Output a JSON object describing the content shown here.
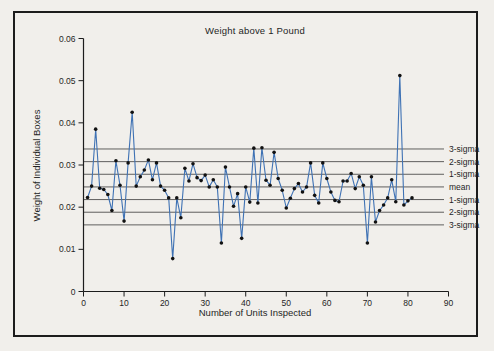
{
  "figure": {
    "title": "Weight above 1 Pound",
    "x_axis_label": "Number of Units Inspected",
    "y_axis_label": "Weight of Individual Boxes"
  },
  "colors": {
    "page_background": "#f1efeb",
    "frame_border": "#1c1c1c",
    "axis": "#1c1c1c",
    "data_line": "#3f72b4",
    "marker": "#111111",
    "control_line": "#3a3a3a",
    "text": "#1f1f1f"
  },
  "chart_data": {
    "type": "line",
    "title": "Weight above 1 Pound",
    "xlabel": "Number of Units Inspected",
    "ylabel": "Weight of Individual Boxes",
    "xlim": [
      0,
      90
    ],
    "ylim": [
      0,
      0.06
    ],
    "grid": false,
    "legend_position": "none",
    "x_ticks": [
      0,
      10,
      20,
      30,
      40,
      50,
      60,
      70,
      80,
      90
    ],
    "x_tick_labels": [
      "0",
      "10",
      "20",
      "30",
      "40",
      "50",
      "60",
      "70",
      "80",
      "90"
    ],
    "y_ticks": [
      0,
      0.01,
      0.02,
      0.03,
      0.04,
      0.05,
      0.06
    ],
    "y_tick_labels": [
      "0",
      "0.01",
      "0.02",
      "0.03",
      "0.04",
      "0.05",
      "0.06"
    ],
    "control_lines": [
      {
        "label": "3-sigma",
        "value": 0.0338
      },
      {
        "label": "2-sigma",
        "value": 0.0308
      },
      {
        "label": "1-sigma",
        "value": 0.0278
      },
      {
        "label": "mean",
        "value": 0.0248
      },
      {
        "label": "1-sigma",
        "value": 0.0218
      },
      {
        "label": "2-sigma",
        "value": 0.0188
      },
      {
        "label": "3-sigma",
        "value": 0.0158
      }
    ],
    "series": [
      {
        "name": "individual box weights",
        "x": [
          1,
          2,
          3,
          4,
          5,
          6,
          7,
          8,
          9,
          10,
          11,
          12,
          13,
          14,
          15,
          16,
          17,
          18,
          19,
          20,
          21,
          22,
          23,
          24,
          25,
          26,
          27,
          28,
          29,
          30,
          31,
          32,
          33,
          34,
          35,
          36,
          37,
          38,
          39,
          40,
          41,
          42,
          43,
          44,
          45,
          46,
          47,
          48,
          49,
          50,
          51,
          52,
          53,
          54,
          55,
          56,
          57,
          58,
          59,
          60,
          61,
          62,
          63,
          64,
          65,
          66,
          67,
          68,
          69,
          70,
          71,
          72,
          73,
          74,
          75,
          76,
          77,
          78,
          79,
          80,
          81
        ],
        "values": [
          0.0223,
          0.025,
          0.0385,
          0.0245,
          0.0242,
          0.023,
          0.0192,
          0.031,
          0.0252,
          0.0167,
          0.0305,
          0.0425,
          0.025,
          0.0272,
          0.0288,
          0.0312,
          0.0265,
          0.0305,
          0.025,
          0.024,
          0.0222,
          0.0078,
          0.0222,
          0.0175,
          0.0292,
          0.0262,
          0.0303,
          0.027,
          0.0263,
          0.0276,
          0.0248,
          0.0265,
          0.0248,
          0.0115,
          0.0295,
          0.0248,
          0.0202,
          0.0232,
          0.0126,
          0.0248,
          0.0212,
          0.034,
          0.021,
          0.0341,
          0.0264,
          0.0252,
          0.033,
          0.0268,
          0.024,
          0.0198,
          0.0221,
          0.0244,
          0.0256,
          0.0236,
          0.0248,
          0.0305,
          0.0228,
          0.021,
          0.0305,
          0.0268,
          0.0236,
          0.0216,
          0.0213,
          0.0262,
          0.0262,
          0.028,
          0.0244,
          0.0272,
          0.0252,
          0.0115,
          0.0272,
          0.0165,
          0.0192,
          0.0205,
          0.0222,
          0.0265,
          0.0213,
          0.0512,
          0.0205,
          0.0215,
          0.0222
        ]
      }
    ]
  }
}
